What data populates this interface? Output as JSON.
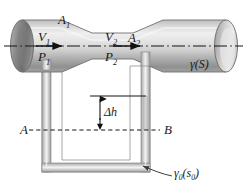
{
  "figure": {
    "name": "venturi-meter-with-u-tube-manometer",
    "colors": {
      "pipe_light": "#e9e9e9",
      "pipe_mid": "#c9c9c9",
      "pipe_dark": "#8e8e8e",
      "pipe_darkest": "#6e6e6e",
      "outline": "#6a6a6a",
      "line": "#1a1a1a",
      "tube_wall": "#a8a8a8",
      "tube_fill": "#ffffff",
      "manometer_fluid": "#c2c2c2",
      "background": "#ffffff"
    }
  },
  "labels": {
    "area_inlet": "A",
    "area_inlet_sub": "1",
    "velocity_inlet": "V",
    "velocity_inlet_sub": "1",
    "pressure_inlet": "P",
    "pressure_inlet_sub": "1",
    "velocity_throat": "V",
    "velocity_throat_sub": "2",
    "area_throat": "A",
    "area_throat_sub": "2",
    "pressure_throat": "P",
    "pressure_throat_sub": "2",
    "delta_h": "Δh",
    "datum_left": "A",
    "datum_right": "B",
    "specific_weight_fluid": "γ(S)",
    "specific_weight_manometer": "γ",
    "specific_weight_manometer_sub": "0",
    "specific_weight_manometer_arg": "(s",
    "specific_weight_manometer_arg_sub": "0",
    "specific_weight_manometer_close": ")"
  },
  "annotations": {
    "centerline_style": "dash-dot",
    "datum_line_style": "dashed",
    "flow_direction": "left-to-right",
    "arrow_count": 2
  }
}
